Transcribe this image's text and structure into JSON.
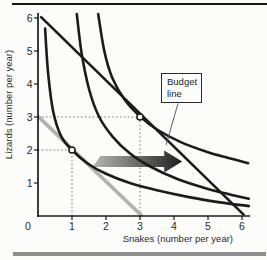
{
  "chart_data": {
    "type": "line",
    "title": "",
    "xlabel": "Snakes (number per year)",
    "ylabel": "Lizards (number per year)",
    "origin_label": "0",
    "xlim": [
      0,
      6.3
    ],
    "ylim": [
      0,
      6.3
    ],
    "x_ticks": [
      1,
      2,
      3,
      4,
      5,
      6
    ],
    "y_ticks": [
      1,
      2,
      3,
      4,
      5,
      6
    ],
    "grid": false,
    "legend": "none",
    "series": [
      {
        "name": "initial-budget-line",
        "kind": "straight",
        "color": "#b3b2b0",
        "width": 3.8,
        "points": [
          [
            0,
            3.02
          ],
          [
            3.06,
            0
          ]
        ]
      },
      {
        "name": "new-budget-line",
        "kind": "straight",
        "color": "#1b1b1b",
        "width": 2.6,
        "points": [
          [
            0.07,
            6.05
          ],
          [
            6.07,
            0.02
          ]
        ]
      },
      {
        "name": "indifference-curve-low",
        "kind": "smooth",
        "color": "#1b1b1b",
        "width": 2.6,
        "points": [
          [
            0.21,
            5.68
          ],
          [
            0.3,
            4.3
          ],
          [
            0.45,
            3.15
          ],
          [
            0.68,
            2.42
          ],
          [
            1.0,
            2.0
          ],
          [
            1.45,
            1.6
          ],
          [
            2.0,
            1.28
          ],
          [
            2.7,
            1.0
          ],
          [
            3.5,
            0.78
          ],
          [
            4.4,
            0.58
          ],
          [
            5.3,
            0.42
          ],
          [
            6.2,
            0.3
          ]
        ]
      },
      {
        "name": "indifference-curve-mid",
        "kind": "smooth",
        "color": "#1b1b1b",
        "width": 2.6,
        "points": [
          [
            1.14,
            6.12
          ],
          [
            1.28,
            4.95
          ],
          [
            1.5,
            3.85
          ],
          [
            1.8,
            3.0
          ],
          [
            2.2,
            2.4
          ],
          [
            2.7,
            1.9
          ],
          [
            3.3,
            1.5
          ],
          [
            4.1,
            1.12
          ],
          [
            5.0,
            0.82
          ],
          [
            5.7,
            0.64
          ],
          [
            6.2,
            0.52
          ]
        ]
      },
      {
        "name": "indifference-curve-high",
        "kind": "smooth",
        "color": "#1b1b1b",
        "width": 2.6,
        "points": [
          [
            1.77,
            6.12
          ],
          [
            1.95,
            5.0
          ],
          [
            2.18,
            4.2
          ],
          [
            2.55,
            3.52
          ],
          [
            3.0,
            3.02
          ],
          [
            3.5,
            2.62
          ],
          [
            4.2,
            2.24
          ],
          [
            4.95,
            1.95
          ],
          [
            5.6,
            1.76
          ],
          [
            6.18,
            1.6
          ]
        ]
      }
    ],
    "tangency_points": [
      [
        1,
        2
      ],
      [
        3,
        3
      ]
    ],
    "guide_lines": [
      {
        "from": [
          0,
          2
        ],
        "to": [
          1,
          2
        ]
      },
      {
        "from": [
          1,
          0
        ],
        "to": [
          1,
          2
        ]
      },
      {
        "from": [
          0,
          3
        ],
        "to": [
          3,
          3
        ]
      },
      {
        "from": [
          3,
          0
        ],
        "to": [
          3,
          3
        ]
      }
    ],
    "annotations": {
      "callout_line1": "Budget",
      "callout_line2": "line",
      "callout_target": [
        3.8,
        2.25
      ],
      "shift_arrow": {
        "y_level": 1.65,
        "from_x": 1.72,
        "to_x": 4.24,
        "color_start": "#b6b6b4",
        "color_end": "#1f1f1f"
      }
    },
    "colors": {
      "axis": "#1b1b1b",
      "guide": "#6a6a6a",
      "point_fill": "#ffffff"
    }
  }
}
